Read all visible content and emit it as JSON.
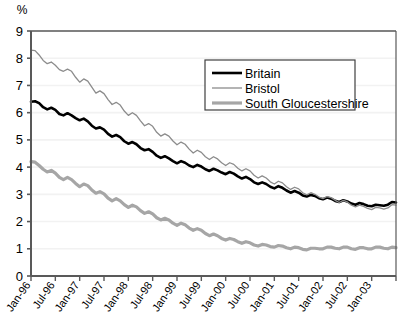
{
  "chart_data": {
    "type": "line",
    "title": "",
    "subtitle": "",
    "xlabel": "",
    "ylabel": "%",
    "ylim": [
      0,
      9
    ],
    "yticks": [
      0,
      1,
      2,
      3,
      4,
      5,
      6,
      7,
      8,
      9
    ],
    "ytick_labels": [
      "0",
      "1",
      "2",
      "3",
      "4",
      "5",
      "6",
      "7",
      "8",
      "9"
    ],
    "grid": true,
    "legend_position": "upper-right",
    "categories": [
      "Jan-96",
      "Feb-96",
      "Mar-96",
      "Apr-96",
      "May-96",
      "Jun-96",
      "Jul-96",
      "Aug-96",
      "Sep-96",
      "Oct-96",
      "Nov-96",
      "Dec-96",
      "Jan-97",
      "Feb-97",
      "Mar-97",
      "Apr-97",
      "May-97",
      "Jun-97",
      "Jul-97",
      "Aug-97",
      "Sep-97",
      "Oct-97",
      "Nov-97",
      "Dec-97",
      "Jan-98",
      "Feb-98",
      "Mar-98",
      "Apr-98",
      "May-98",
      "Jun-98",
      "Jul-98",
      "Aug-98",
      "Sep-98",
      "Oct-98",
      "Nov-98",
      "Dec-98",
      "Jan-99",
      "Feb-99",
      "Mar-99",
      "Apr-99",
      "May-99",
      "Jun-99",
      "Jul-99",
      "Aug-99",
      "Sep-99",
      "Oct-99",
      "Nov-99",
      "Dec-99",
      "Jan-00",
      "Feb-00",
      "Mar-00",
      "Apr-00",
      "May-00",
      "Jun-00",
      "Jul-00",
      "Aug-00",
      "Sep-00",
      "Oct-00",
      "Nov-00",
      "Dec-00",
      "Jan-01",
      "Feb-01",
      "Mar-01",
      "Apr-01",
      "May-01",
      "Jun-01",
      "Jul-01",
      "Aug-01",
      "Sep-01",
      "Oct-01",
      "Nov-01",
      "Dec-01",
      "Jan-02",
      "Feb-02",
      "Mar-02",
      "Apr-02",
      "May-02",
      "Jun-02",
      "Jul-02",
      "Aug-02",
      "Sep-02",
      "Oct-02",
      "Nov-02",
      "Dec-02",
      "Jan-03",
      "Feb-03",
      "Mar-03",
      "Apr-03",
      "May-03",
      "Jun-03",
      "Jul-03"
    ],
    "xtick_labels": [
      "Jan-96",
      "Jul-96",
      "Jan-97",
      "Jul-97",
      "Jan-98",
      "Jul-98",
      "Jan-99",
      "Jul-99",
      "Jan-00",
      "Jul-00",
      "Jan-01",
      "Jul-01",
      "Jan-02",
      "Jul-02",
      "Jan-03"
    ],
    "series": [
      {
        "name": "Britain",
        "color": "#000000",
        "width": 2.6,
        "values": [
          6.4,
          6.42,
          6.35,
          6.2,
          6.12,
          6.18,
          6.1,
          5.95,
          5.9,
          5.98,
          5.9,
          5.8,
          5.72,
          5.78,
          5.68,
          5.52,
          5.42,
          5.46,
          5.38,
          5.22,
          5.12,
          5.18,
          5.1,
          4.95,
          4.86,
          4.92,
          4.84,
          4.7,
          4.62,
          4.66,
          4.56,
          4.42,
          4.34,
          4.4,
          4.32,
          4.22,
          4.14,
          4.22,
          4.16,
          4.06,
          4.0,
          4.08,
          4.02,
          3.92,
          3.86,
          3.94,
          3.88,
          3.8,
          3.74,
          3.82,
          3.76,
          3.66,
          3.58,
          3.64,
          3.56,
          3.44,
          3.38,
          3.44,
          3.38,
          3.28,
          3.22,
          3.3,
          3.24,
          3.14,
          3.06,
          3.12,
          3.06,
          2.96,
          2.92,
          2.98,
          2.94,
          2.86,
          2.82,
          2.88,
          2.84,
          2.76,
          2.72,
          2.78,
          2.74,
          2.66,
          2.62,
          2.68,
          2.64,
          2.58,
          2.56,
          2.62,
          2.6,
          2.58,
          2.62,
          2.72,
          2.7
        ]
      },
      {
        "name": "Bristol",
        "color": "#8c8c8c",
        "width": 1.3,
        "values": [
          8.3,
          8.28,
          8.12,
          7.92,
          7.8,
          7.86,
          7.74,
          7.58,
          7.52,
          7.6,
          7.52,
          7.3,
          7.12,
          7.24,
          7.16,
          6.94,
          6.72,
          6.8,
          6.7,
          6.48,
          6.3,
          6.38,
          6.28,
          6.06,
          5.9,
          6.0,
          5.9,
          5.7,
          5.52,
          5.6,
          5.5,
          5.28,
          5.14,
          5.22,
          5.14,
          4.96,
          4.82,
          4.92,
          4.84,
          4.66,
          4.52,
          4.62,
          4.54,
          4.38,
          4.28,
          4.38,
          4.3,
          4.16,
          4.06,
          4.16,
          4.1,
          3.96,
          3.86,
          3.94,
          3.86,
          3.7,
          3.6,
          3.68,
          3.6,
          3.46,
          3.38,
          3.48,
          3.42,
          3.28,
          3.18,
          3.26,
          3.2,
          3.06,
          2.98,
          3.06,
          3.0,
          2.9,
          2.84,
          2.92,
          2.88,
          2.78,
          2.7,
          2.78,
          2.72,
          2.6,
          2.54,
          2.6,
          2.56,
          2.48,
          2.44,
          2.52,
          2.5,
          2.46,
          2.5,
          2.62,
          2.6
        ]
      },
      {
        "name": "South Gloucestershire",
        "color": "#a6a6a6",
        "width": 3.2,
        "values": [
          4.2,
          4.18,
          4.06,
          3.92,
          3.82,
          3.88,
          3.78,
          3.62,
          3.54,
          3.62,
          3.54,
          3.4,
          3.28,
          3.38,
          3.32,
          3.16,
          3.04,
          3.1,
          3.02,
          2.86,
          2.76,
          2.84,
          2.76,
          2.62,
          2.52,
          2.6,
          2.54,
          2.4,
          2.3,
          2.36,
          2.28,
          2.14,
          2.06,
          2.12,
          2.06,
          1.94,
          1.86,
          1.94,
          1.88,
          1.76,
          1.68,
          1.74,
          1.68,
          1.56,
          1.48,
          1.54,
          1.48,
          1.38,
          1.32,
          1.38,
          1.34,
          1.26,
          1.2,
          1.26,
          1.22,
          1.14,
          1.1,
          1.16,
          1.14,
          1.08,
          1.06,
          1.12,
          1.1,
          1.04,
          1.0,
          1.06,
          1.04,
          0.98,
          0.96,
          1.02,
          1.02,
          1.0,
          1.0,
          1.06,
          1.06,
          1.02,
          1.0,
          1.06,
          1.06,
          1.0,
          0.98,
          1.04,
          1.04,
          1.0,
          1.0,
          1.06,
          1.06,
          1.02,
          1.0,
          1.06,
          1.04
        ]
      }
    ]
  },
  "legend": {
    "items": [
      {
        "label": "Britain"
      },
      {
        "label": "Bristol"
      },
      {
        "label": "South Gloucestershire"
      }
    ]
  },
  "axes": {
    "y_unit_label": "%"
  },
  "colors": {
    "britain": "#000000",
    "bristol": "#8c8c8c",
    "south_gloucestershire": "#a6a6a6",
    "axis": "#595959",
    "grid": "#f2f2f2",
    "background": "#ffffff"
  }
}
